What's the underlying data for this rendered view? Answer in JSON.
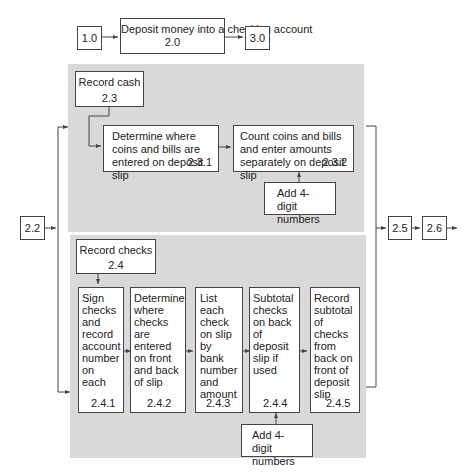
{
  "top_row": {
    "prev": "1.0",
    "main": {
      "label": "Deposit money into a checking account",
      "id": "2.0"
    },
    "next": "3.0"
  },
  "left_input": "2.2",
  "record_cash": {
    "header": {
      "label": "Record cash",
      "id": "2.3"
    },
    "steps": [
      {
        "label": "Determine where coins and bills are entered on deposit slip",
        "id": "2.3.1"
      },
      {
        "label": "Count coins and bills and enter amounts separately on deposit slip",
        "id": "2.3.2"
      }
    ],
    "support": "Add 4-digit numbers"
  },
  "record_checks": {
    "header": {
      "label": "Record checks",
      "id": "2.4"
    },
    "steps": [
      {
        "label": "Sign checks and record account number on each",
        "id": "2.4.1"
      },
      {
        "label": "Determine where checks are entered on front and back of slip",
        "id": "2.4.2"
      },
      {
        "label": "List each check on slip by bank number and amount",
        "id": "2.4.3"
      },
      {
        "label": "Subtotal checks on back of deposit slip if used",
        "id": "2.4.4"
      },
      {
        "label": "Record subtotal of checks from back on front of deposit slip",
        "id": "2.4.5"
      }
    ],
    "support": "Add 4-digit numbers"
  },
  "outputs": [
    "2.5",
    "2.6"
  ],
  "colors": {
    "panel": "#d9d9d9",
    "line": "#444444"
  }
}
